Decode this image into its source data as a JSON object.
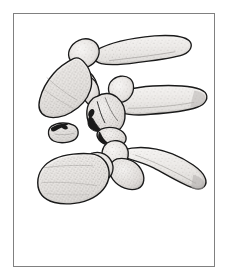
{
  "figure": {
    "domain": "Natural-Image",
    "kind": "anatomical-line-drawing",
    "title": "Lateral view of three vertebrae with fracture-dislocation",
    "view": "lateral",
    "background_color": "#ffffff",
    "frame": {
      "border_color": "#808080",
      "border_width_px": 1,
      "x": 13,
      "y": 13,
      "width": 202,
      "height": 254
    },
    "style": {
      "outline_color": "#1a1a1a",
      "outline_width_px": 1.4,
      "bone_fill_light": "#f0eeec",
      "bone_fill_mid": "#dcd9d6",
      "bone_fill_shadow": "#c2bfbc",
      "stipple_color": "#8a8784",
      "dark_fracture_color": "#1a1a1a",
      "technique": "stippled pen-and-ink"
    },
    "elements": [
      {
        "id": "vertebra-upper",
        "label": "Upper vertebra",
        "parts": [
          "vertebral body",
          "pedicle",
          "superior articular process",
          "spinous process"
        ],
        "position": "top-left to top-right",
        "spinous_process_direction": "posterior-superior, long and tapered"
      },
      {
        "id": "vertebra-middle",
        "label": "Middle vertebra (fractured)",
        "parts": [
          "fractured vertebral body",
          "lamina",
          "spinous process"
        ],
        "position": "center",
        "note": "Shows comminuted fracture with dark disrupted cortical margin"
      },
      {
        "id": "vertebra-lower",
        "label": "Lower vertebra",
        "parts": [
          "vertebral body",
          "superior articular facet",
          "transverse process",
          "spinous process"
        ],
        "position": "bottom",
        "spinous_process_direction": "posterior-inferior, long and tapered"
      },
      {
        "id": "bone-fragment",
        "label": "Displaced bone fragment",
        "position": "left of center, anterior",
        "note": "Small detached avulsed fragment with dark fracture surface"
      }
    ]
  }
}
